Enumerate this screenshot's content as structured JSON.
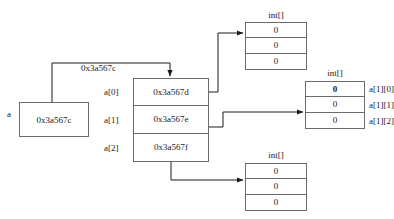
{
  "diagram": {
    "title_artifact": "· · · ·· ·· ··",
    "variable": {
      "name": "a",
      "value": "0x3a567c"
    },
    "main_array": {
      "address_label": "0x3a567c",
      "index_labels": [
        "a[0]",
        "a[1]",
        "a[2]"
      ],
      "values": [
        "0x3a567d",
        "0x3a567e",
        "0x3a567f"
      ]
    },
    "sub_arrays": [
      {
        "id": "top",
        "type_label": "int[]",
        "values": [
          "0",
          "0",
          "0"
        ],
        "element_labels": [
          "",
          "",
          ""
        ]
      },
      {
        "id": "right",
        "type_label": "int[]",
        "values": [
          "0",
          "0",
          "0"
        ],
        "element_labels": [
          "a[1][0]",
          "a[1][1]",
          "a[1][2]"
        ]
      },
      {
        "id": "bottom",
        "type_label": "int[]",
        "values": [
          "0",
          "0",
          "0"
        ],
        "element_labels": [
          "",
          "",
          ""
        ]
      }
    ],
    "colors": {
      "stroke": "#6b6b6b",
      "arrow": "#1a1a1a",
      "text": "#1a1a1a",
      "background": "#ffffff"
    }
  }
}
